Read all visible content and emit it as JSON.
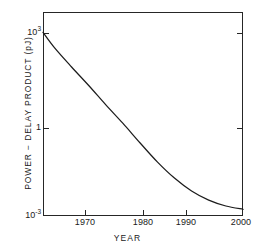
{
  "chart_data": {
    "type": "line",
    "title": "",
    "xlabel": "YEAR",
    "ylabel": "POWER − DELAY PRODUCT (pJ)",
    "yscale": "log",
    "xlim": [
      1965,
      2000
    ],
    "ylim": [
      0.001,
      10000
    ],
    "grid": false,
    "legend": null,
    "x_ticks": [
      1970,
      1980,
      1990,
      2000
    ],
    "x_tick_labels": [
      "1970",
      "1980",
      "1990",
      "2000"
    ],
    "y_ticks": [
      1000,
      1,
      0.001
    ],
    "y_tick_labels": [
      "10³",
      "1",
      "10⁻³"
    ],
    "series": [
      {
        "name": "power-delay product",
        "x": [
          1965,
          1967,
          1970,
          1973,
          1976,
          1979,
          1982,
          1985,
          1988,
          1991,
          1994,
          1997,
          2000
        ],
        "y": [
          2000,
          600,
          130,
          30,
          6.5,
          1.5,
          0.32,
          0.072,
          0.02,
          0.0072,
          0.0035,
          0.0022,
          0.0017
        ]
      }
    ]
  },
  "axes": {
    "y_tick_labels": [
      {
        "mantissa": "10",
        "exponent": "3"
      },
      {
        "mantissa": "1",
        "exponent": ""
      },
      {
        "mantissa": "10",
        "exponent": "-3"
      }
    ],
    "x_tick_labels": [
      "1970",
      "1980",
      "1990",
      "2000"
    ],
    "x_title": "YEAR",
    "y_title": "POWER − DELAY PRODUCT (pJ)"
  },
  "style": {
    "line_color": "#1c1c1c",
    "axis_color": "#262626",
    "background": "#ffffff"
  }
}
